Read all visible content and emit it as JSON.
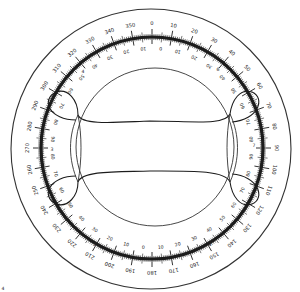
{
  "diagram": {
    "colors": {
      "stroke": "#1c1c1c",
      "thin": "#333333",
      "background": "#ffffff"
    },
    "outer_circle": {
      "cx": 151,
      "cy": 149,
      "r": 140
    },
    "scale_ring": {
      "cx": 152,
      "cy": 148,
      "r": 111,
      "thickness": 3.2
    },
    "inner_circle": {
      "cx": 155,
      "cy": 147,
      "r": 79
    },
    "outer_degree_labels": [
      "0",
      "10",
      "20",
      "30",
      "40",
      "50",
      "60",
      "70",
      "80",
      "90",
      "100",
      "110",
      "120",
      "130",
      "140",
      "150",
      "160",
      "170",
      "180",
      "190",
      "200",
      "210",
      "220",
      "230",
      "240",
      "250",
      "260",
      "270",
      "280",
      "290",
      "300",
      "310",
      "320",
      "330",
      "340",
      "350"
    ],
    "inner_scale_labels": [
      "0",
      "10",
      "20",
      "30",
      "40",
      "50",
      "60",
      "70",
      "80",
      "90",
      "80",
      "70",
      "60",
      "50",
      "40",
      "30",
      "20",
      "10",
      "0",
      "10",
      "20",
      "30",
      "40",
      "50",
      "60",
      "70",
      "80",
      "90",
      "80",
      "70",
      "60",
      "50",
      "40",
      "30",
      "20",
      "10"
    ],
    "axis_markers": {
      "left": "3",
      "right": "7",
      "top_left": "4",
      "top_right": "6",
      "bottom_left": "2",
      "bottom_right": "8"
    },
    "corner_mark": "4"
  }
}
